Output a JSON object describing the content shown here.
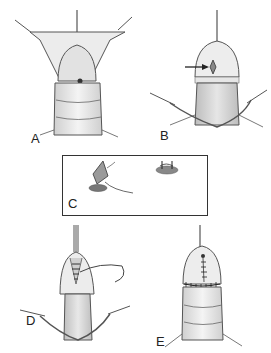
{
  "figure": {
    "panels": [
      {
        "id": "A",
        "label": "A",
        "description": "Glans exposed with stay sutures, meatus visible"
      },
      {
        "id": "B",
        "label": "B",
        "description": "Meatal incision with arrow pointing to site"
      },
      {
        "id": "C",
        "label": "C",
        "description": "Inset detail: diamond-shaped meatotomy and suture closure"
      },
      {
        "id": "D",
        "label": "D",
        "description": "Suturing glans wings with needle and thread"
      },
      {
        "id": "E",
        "label": "E",
        "description": "Completed repair with circumferential suture line"
      }
    ],
    "colors": {
      "line": "#444444",
      "skin_shade": "#dcdcdc",
      "skin_light": "#f2f2f2",
      "border": "#333333"
    }
  }
}
